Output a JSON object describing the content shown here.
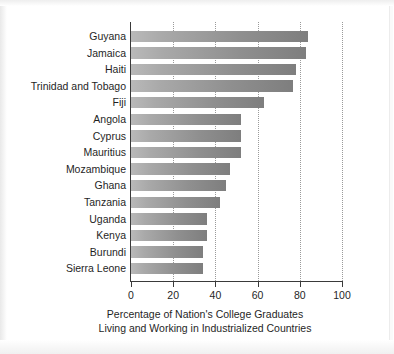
{
  "chart_data": {
    "type": "bar",
    "orientation": "horizontal",
    "title": "",
    "xlabel": "Percentage of Nation's College Graduates Living and Working in Industrialized Countries",
    "ylabel": "",
    "xlim": [
      0,
      100
    ],
    "xticks": [
      0,
      20,
      40,
      60,
      80,
      100
    ],
    "xtick_labels": [
      "0",
      "20",
      "40",
      "60",
      "80",
      "100"
    ],
    "grid": "vertical-dotted",
    "legend": "none",
    "categories": [
      "Guyana",
      "Jamaica",
      "Haiti",
      "Trinidad and Tobago",
      "Fiji",
      "Angola",
      "Cyprus",
      "Mauritius",
      "Mozambique",
      "Ghana",
      "Tanzania",
      "Uganda",
      "Kenya",
      "Burundi",
      "Sierra Leone"
    ],
    "values": [
      84,
      83,
      78,
      77,
      63,
      52,
      52,
      52,
      47,
      45,
      42,
      36,
      36,
      34,
      34
    ]
  },
  "caption": {
    "line1": "Percentage of Nation's College Graduates",
    "line2": "Living and Working in Industrialized Countries"
  },
  "colors": {
    "bar_light": "#b9b9b9",
    "bar_dark": "#7e7e7e",
    "axis": "#3a3a3a",
    "grid": "#9a9a9a",
    "text": "#1f1f1f",
    "background": "#ffffff"
  }
}
